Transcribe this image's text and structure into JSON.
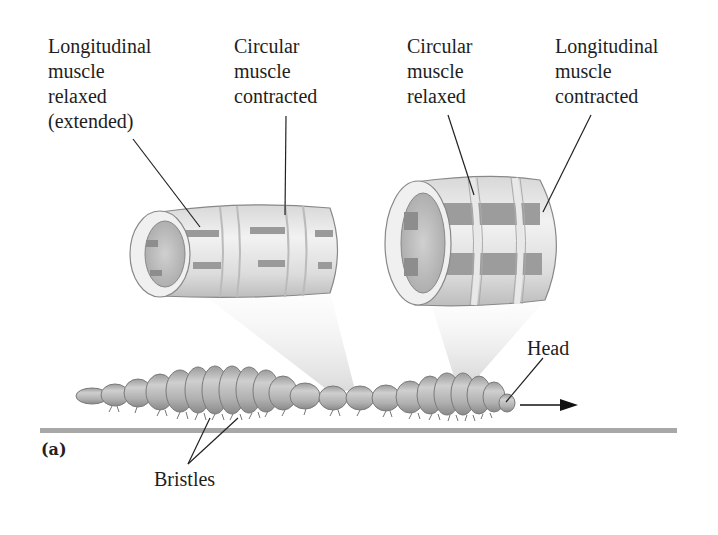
{
  "figure": {
    "panel_label": "(a)",
    "labels": {
      "left_tube_longitudinal": "Longitudinal\nmuscle\nrelaxed\n(extended)",
      "left_tube_circular": "Circular\nmuscle\ncontracted",
      "right_tube_circular": "Circular\nmuscle\nrelaxed",
      "right_tube_longitudinal": "Longitudinal\nmuscle\ncontracted",
      "head": "Head",
      "bristles": "Bristles"
    },
    "components": [
      {
        "id": "left-tube",
        "description": "Segment with circular muscle contracted: long and thin"
      },
      {
        "id": "right-tube",
        "description": "Segment with longitudinal muscle contracted: short and thick"
      },
      {
        "id": "earthworm",
        "description": "Segmented earthworm moving right along ground"
      },
      {
        "id": "direction-arrow",
        "description": "Arrow indicating direction of movement (right)"
      }
    ],
    "colors": {
      "tube_fill": "#e6e6e6",
      "tube_band": "#9a9a9a",
      "worm_fill": "#b8b8b8",
      "ground": "#a8a8a8",
      "leader": "#222222"
    }
  }
}
